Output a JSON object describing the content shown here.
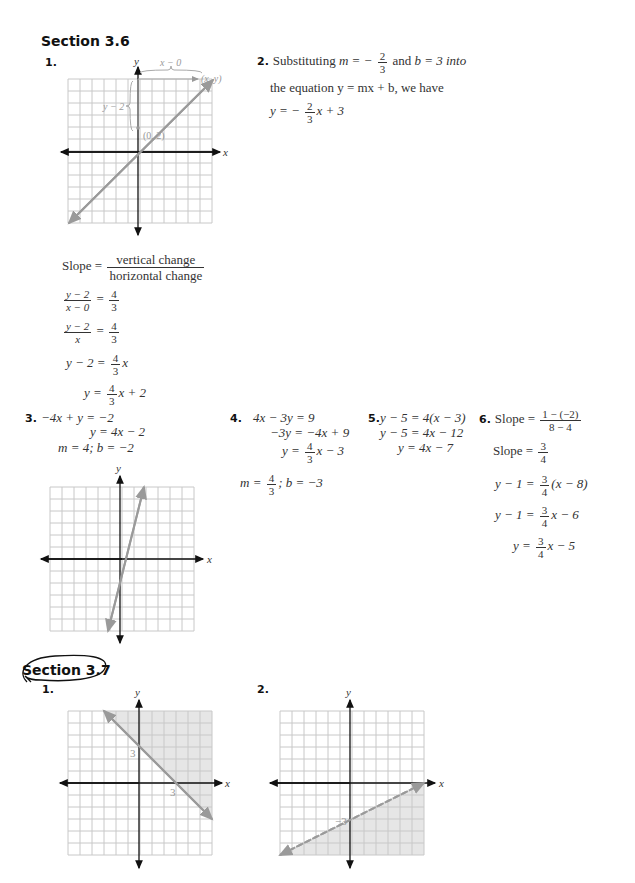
{
  "sections": [
    {
      "title": "Section 3.6",
      "circled": false
    },
    {
      "title": "Section 3.7",
      "circled": true
    }
  ],
  "s36": {
    "p1": {
      "number": "1.",
      "graph_labels": {
        "x_axis": "x",
        "y_axis": "y",
        "horizontal_change": "x − 0",
        "vertical_change": "y − 2",
        "point_start": "(0, 2)",
        "point_end": "(x, y)"
      },
      "slope_label": "Slope =",
      "slope_num": "vertical change",
      "slope_den": "horizontal change",
      "steps": [
        {
          "lhs_num": "y − 2",
          "lhs_den": "x − 0",
          "eq": "=",
          "rhs_num": "4",
          "rhs_den": "3"
        },
        {
          "lhs_num": "y − 2",
          "lhs_den": "x",
          "eq": "=",
          "rhs_num": "4",
          "rhs_den": "3"
        }
      ],
      "step3_lhs": "y − 2 =",
      "step3_num": "4",
      "step3_den": "3",
      "step3_tail": "x",
      "step4_lhs": "y =",
      "step4_num": "4",
      "step4_den": "3",
      "step4_tail": "x + 2"
    },
    "p2": {
      "number": "2.",
      "line1_a": "Substituting",
      "line1_m": "m = −",
      "line1_num": "2",
      "line1_den": "3",
      "line1_b": "and",
      "line1_c": "b = 3 into",
      "line2": "the equation y = mx + b, we have",
      "result_lhs": "y = −",
      "result_num": "2",
      "result_den": "3",
      "result_tail": "x + 3"
    },
    "p3": {
      "number": "3.",
      "lines": [
        "−4x + y = −2",
        "y = 4x − 2",
        "m = 4; b = −2"
      ],
      "graph_labels": {
        "x_axis": "x",
        "y_axis": "y"
      }
    },
    "p4": {
      "number": "4.",
      "line1": "4x − 3y = 9",
      "line2": "−3y = −4x + 9",
      "line3_lhs": "y =",
      "line3_num": "4",
      "line3_den": "3",
      "line3_tail": "x − 3",
      "line4_lhs": "m =",
      "line4_num": "4",
      "line4_den": "3",
      "line4_tail": "; b = −3"
    },
    "p5": {
      "number": "5.",
      "lines": [
        "y − 5 = 4(x − 3)",
        "y − 5 = 4x − 12",
        "y = 4x − 7"
      ]
    },
    "p6": {
      "number": "6.",
      "l1_lhs": "Slope =",
      "l1_num": "1 − (−2)",
      "l1_den": "8 − 4",
      "l2_lhs": "Slope =",
      "l2_num": "3",
      "l2_den": "4",
      "l3_lhs": "y − 1 =",
      "l3_num": "3",
      "l3_den": "4",
      "l3_tail": "(x − 8)",
      "l4_lhs": "y − 1 =",
      "l4_num": "3",
      "l4_den": "4",
      "l4_tail": "x − 6",
      "l5_lhs": "y =",
      "l5_num": "3",
      "l5_den": "4",
      "l5_tail": "x − 5"
    }
  },
  "s37": {
    "p1": {
      "number": "1.",
      "graph_labels": {
        "x_axis": "x",
        "y_axis": "y",
        "y_intercept": "3",
        "x_intercept": "3"
      },
      "boundary": "solid",
      "shade": "above"
    },
    "p2": {
      "number": "2.",
      "graph_labels": {
        "x_axis": "x",
        "y_axis": "y",
        "y_intercept": "−3"
      },
      "boundary": "dashed",
      "shade": "below"
    }
  },
  "colors": {
    "grid": "#c8c8c8",
    "axis": "#111111",
    "line": "#9a9a9a",
    "shade": "#e6e6e6",
    "label": "#999999"
  }
}
